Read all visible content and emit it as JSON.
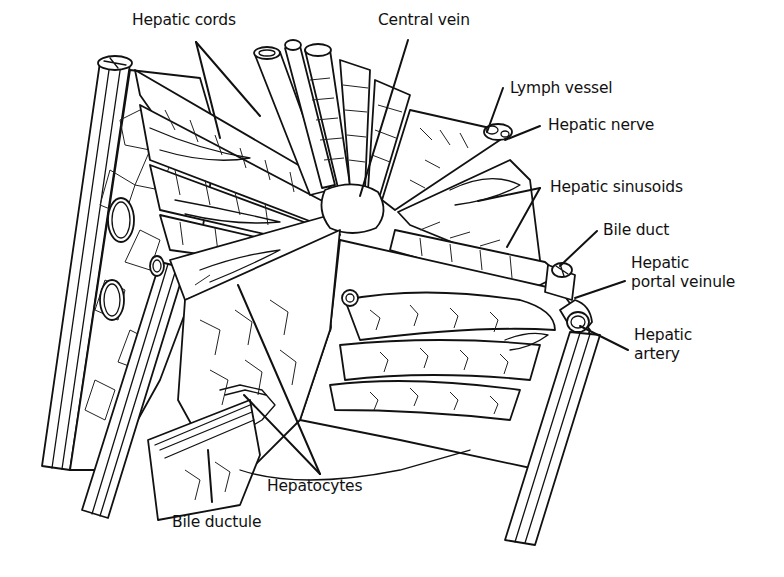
{
  "diagram": {
    "labels": {
      "hepatic_cords": "Hepatic cords",
      "central_vein": "Central vein",
      "lymph_vessel": "Lymph vessel",
      "hepatic_nerve": "Hepatic nerve",
      "hepatic_sinusoids": "Hepatic sinusoids",
      "bile_duct": "Bile duct",
      "hepatic_portal_veinule_line1": "Hepatic",
      "hepatic_portal_veinule_line2": "portal veinule",
      "hepatic_artery_line1": "Hepatic",
      "hepatic_artery_line2": "artery",
      "hepatocytes": "Hepatocytes",
      "bile_ductule": "Bile ductule"
    },
    "colors": {
      "ink": "#111111",
      "background": "#ffffff"
    }
  }
}
